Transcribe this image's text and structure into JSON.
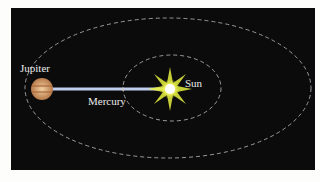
{
  "diagram": {
    "labels": {
      "jupiter": "Jupiter",
      "mercury": "Mercury",
      "sun": "Sun"
    },
    "colors": {
      "background": "#0b0b0b",
      "orbit": "#9a9a9a",
      "line": "#b8c8e8",
      "sun": "#ffffa0",
      "jupiter": "#d9a070"
    }
  }
}
